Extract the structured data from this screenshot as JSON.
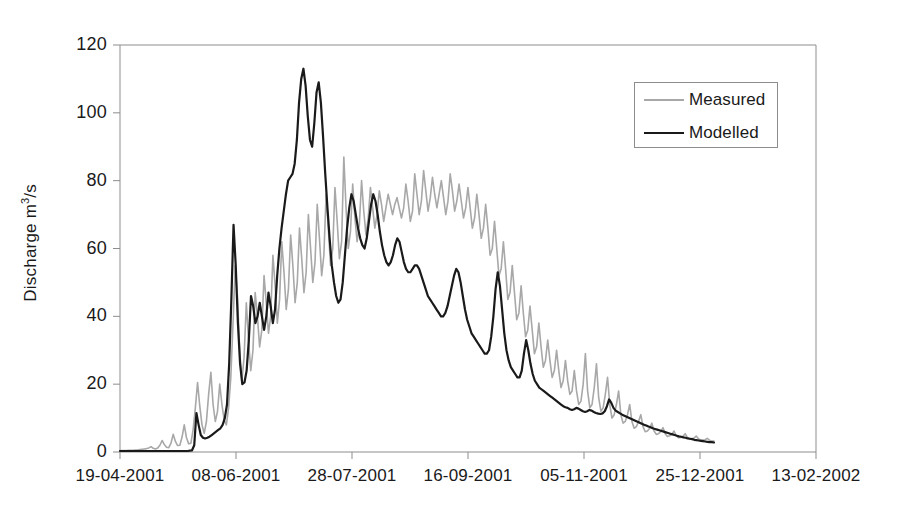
{
  "chart_data": {
    "type": "line",
    "title": "",
    "xlabel": "",
    "ylabel": "Discharge m3/s",
    "ylabel_base": "Discharge m",
    "ylabel_sup": "3",
    "ylabel_tail": "/s",
    "ylim": [
      0,
      120
    ],
    "ytick_labels": [
      "0",
      "20",
      "40",
      "60",
      "80",
      "100",
      "120"
    ],
    "ytick_values": [
      0,
      20,
      40,
      60,
      80,
      100,
      120
    ],
    "xtick_labels": [
      "19-04-2001",
      "08-06-2001",
      "28-07-2001",
      "16-09-2001",
      "05-11-2001",
      "25-12-2001",
      "13-02-2002"
    ],
    "xtick_index": [
      0,
      50,
      100,
      150,
      200,
      250,
      300
    ],
    "xlim_index": [
      0,
      300
    ],
    "grid": false,
    "legend_position": "top-right",
    "legend": [
      "Measured",
      "Modelled"
    ],
    "colors": {
      "measured": "#a8a8a8",
      "modelled": "#1a1a1a",
      "axis": "#8d8d8d",
      "text": "#1a1a1a",
      "background": "#ffffff"
    },
    "series": [
      {
        "name": "Measured",
        "color": "#a8a8a8",
        "linewidth": 1.6,
        "x_start_index": 0,
        "x_end_index": 256,
        "values": [
          0.4,
          0.4,
          0.4,
          0.4,
          0.5,
          0.5,
          0.5,
          0.6,
          0.6,
          0.7,
          0.8,
          0.9,
          1.0,
          1.2,
          1.6,
          1.1,
          0.9,
          1.2,
          2.0,
          3.4,
          2.2,
          1.4,
          1.3,
          2.6,
          5.2,
          3.1,
          1.9,
          2.0,
          4.4,
          8.0,
          4.2,
          2.4,
          2.6,
          6.6,
          13.0,
          20.5,
          13.5,
          8.0,
          5.5,
          9.0,
          17.0,
          23.5,
          14.0,
          9.0,
          12.0,
          20.0,
          14.0,
          9.5,
          8.0,
          13.0,
          22.0,
          38.0,
          55.0,
          46.0,
          30.0,
          21.0,
          28.0,
          44.0,
          33.0,
          24.0,
          30.0,
          47.0,
          40.0,
          31.0,
          36.0,
          52.0,
          44.0,
          35.0,
          40.0,
          58.0,
          49.0,
          38.0,
          45.0,
          62.0,
          53.0,
          42.0,
          48.0,
          64.0,
          55.0,
          44.0,
          50.0,
          66.0,
          57.0,
          47.0,
          53.0,
          70.0,
          60.0,
          50.0,
          56.0,
          73.0,
          63.0,
          52.0,
          58.0,
          76.0,
          66.0,
          55.0,
          60.0,
          78.0,
          68.0,
          57.0,
          62.0,
          87.0,
          72.0,
          60.0,
          65.0,
          79.0,
          69.0,
          62.0,
          67.0,
          80.0,
          71.0,
          64.0,
          69.0,
          78.0,
          72.0,
          66.0,
          70.0,
          77.0,
          73.0,
          68.0,
          72.0,
          76.0,
          73.0,
          70.0,
          73.0,
          75.0,
          72.0,
          69.0,
          72.0,
          79.0,
          74.0,
          68.0,
          71.0,
          82.0,
          76.0,
          70.0,
          74.0,
          83.0,
          77.0,
          71.0,
          75.0,
          81.0,
          76.0,
          72.0,
          76.0,
          80.0,
          75.0,
          70.0,
          74.0,
          82.0,
          77.0,
          71.0,
          74.0,
          79.0,
          74.0,
          69.0,
          72.0,
          78.0,
          72.0,
          66.0,
          69.0,
          76.0,
          70.0,
          63.0,
          66.0,
          73.0,
          66.0,
          58.0,
          60.0,
          68.0,
          60.0,
          52.0,
          54.0,
          62.0,
          54.0,
          45.0,
          47.0,
          55.0,
          47.0,
          39.0,
          41.0,
          49.0,
          41.0,
          34.0,
          36.0,
          43.0,
          36.0,
          29.0,
          31.0,
          38.0,
          31.0,
          25.0,
          27.0,
          33.0,
          27.0,
          22.0,
          24.0,
          30.0,
          24.0,
          19.0,
          21.0,
          27.0,
          21.0,
          17.0,
          18.0,
          24.0,
          18.0,
          14.0,
          15.0,
          20.0,
          29.0,
          18.0,
          13.0,
          14.0,
          19.0,
          26.0,
          16.0,
          12.0,
          13.0,
          17.0,
          22.0,
          14.0,
          10.0,
          11.0,
          14.0,
          18.0,
          11.0,
          8.5,
          9.0,
          11.0,
          14.0,
          9.0,
          7.0,
          7.5,
          9.0,
          11.0,
          7.5,
          6.0,
          6.2,
          7.0,
          8.5,
          6.2,
          5.2,
          5.4,
          6.0,
          7.2,
          5.4,
          4.6,
          4.8,
          5.2,
          6.2,
          4.8,
          4.2,
          4.3,
          4.6,
          5.4,
          4.3,
          3.8,
          3.9,
          4.1,
          4.7,
          3.9,
          3.5,
          3.5,
          3.6,
          4.0,
          3.5,
          3.2,
          3.2
        ]
      },
      {
        "name": "Modelled",
        "color": "#1a1a1a",
        "linewidth": 2.2,
        "x_start_index": 0,
        "x_end_index": 256,
        "values": [
          0.3,
          0.3,
          0.3,
          0.3,
          0.3,
          0.3,
          0.3,
          0.3,
          0.3,
          0.3,
          0.3,
          0.3,
          0.3,
          0.3,
          0.3,
          0.3,
          0.3,
          0.3,
          0.3,
          0.3,
          0.3,
          0.3,
          0.3,
          0.3,
          0.3,
          0.3,
          0.3,
          0.3,
          0.3,
          0.3,
          0.3,
          0.3,
          0.4,
          0.5,
          2.0,
          11.5,
          8.0,
          5.0,
          4.2,
          4.0,
          4.2,
          4.5,
          5.0,
          5.5,
          6.0,
          6.5,
          7.0,
          8.0,
          10.0,
          14.0,
          26.0,
          45.0,
          67.0,
          55.0,
          38.0,
          26.0,
          20.0,
          20.5,
          24.0,
          33.0,
          46.0,
          43.0,
          38.0,
          40.0,
          44.0,
          40.0,
          36.0,
          40.0,
          47.0,
          43.0,
          38.0,
          42.0,
          52.0,
          60.0,
          66.0,
          71.0,
          76.0,
          80.0,
          81.0,
          82.0,
          85.0,
          92.0,
          103.0,
          110.0,
          113.0,
          108.0,
          99.0,
          92.0,
          90.0,
          97.0,
          106.0,
          109.0,
          103.0,
          93.0,
          82.0,
          72.0,
          63.0,
          55.0,
          50.0,
          46.0,
          44.0,
          45.0,
          50.0,
          58.0,
          66.0,
          72.0,
          76.0,
          74.0,
          70.0,
          66.0,
          63.0,
          61.0,
          60.0,
          63.0,
          68.0,
          73.0,
          76.0,
          74.0,
          70.0,
          65.0,
          61.0,
          58.0,
          56.0,
          55.0,
          56.0,
          58.0,
          61.0,
          63.0,
          62.0,
          59.0,
          56.0,
          54.0,
          53.0,
          53.0,
          54.0,
          55.0,
          55.0,
          54.0,
          52.0,
          50.0,
          48.0,
          46.0,
          45.0,
          44.0,
          43.0,
          42.0,
          41.0,
          40.0,
          40.0,
          41.0,
          43.0,
          46.0,
          49.0,
          52.0,
          54.0,
          53.0,
          50.0,
          46.0,
          42.0,
          39.0,
          37.0,
          35.0,
          34.0,
          33.0,
          32.0,
          31.0,
          30.0,
          29.0,
          29.0,
          30.0,
          34.0,
          40.0,
          48.0,
          53.0,
          49.0,
          42.0,
          35.0,
          30.0,
          27.0,
          25.0,
          24.0,
          23.0,
          22.0,
          22.0,
          24.0,
          29.0,
          33.0,
          30.0,
          26.0,
          23.0,
          21.0,
          20.0,
          19.0,
          18.5,
          18.0,
          17.5,
          17.0,
          16.5,
          16.0,
          15.5,
          15.0,
          14.5,
          14.0,
          13.5,
          13.2,
          13.0,
          12.6,
          12.4,
          12.6,
          13.0,
          12.8,
          12.4,
          12.0,
          11.8,
          12.0,
          12.4,
          12.2,
          11.8,
          11.5,
          11.3,
          11.2,
          11.4,
          12.0,
          13.5,
          15.5,
          14.5,
          13.0,
          12.2,
          11.8,
          11.4,
          11.0,
          10.7,
          10.4,
          10.1,
          9.8,
          9.5,
          9.2,
          8.9,
          8.6,
          8.3,
          8.0,
          7.8,
          7.5,
          7.3,
          7.0,
          6.8,
          6.6,
          6.4,
          6.2,
          6.0,
          5.8,
          5.6,
          5.4,
          5.2,
          5.0,
          4.8,
          4.6,
          4.5,
          4.3,
          4.2,
          4.0,
          3.9,
          3.8,
          3.6,
          3.5,
          3.4,
          3.3,
          3.2,
          3.1,
          3.0,
          2.9,
          2.9,
          2.8
        ]
      }
    ]
  },
  "axes": {
    "plot_left_px": 120,
    "plot_right_px": 816,
    "plot_top_px": 45,
    "plot_bottom_px": 452
  }
}
